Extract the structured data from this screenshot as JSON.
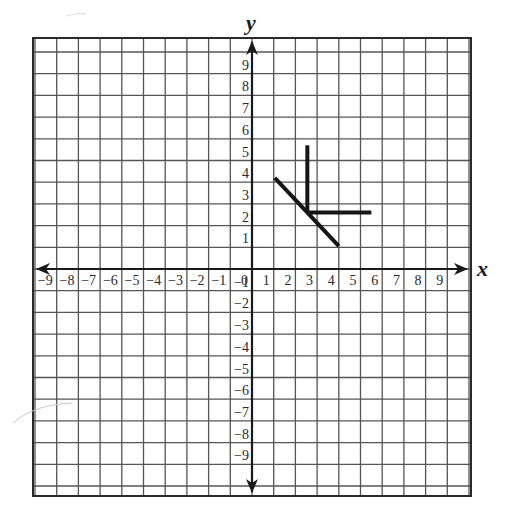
{
  "chart_data": {
    "type": "line",
    "title": "",
    "xlabel": "x",
    "ylabel": "y",
    "xlim": [
      -10,
      10
    ],
    "ylim": [
      -10.5,
      10.6
    ],
    "grid": true,
    "x_ticks": [
      -9,
      -8,
      -7,
      -6,
      -5,
      -4,
      -3,
      -2,
      -1,
      0,
      1,
      2,
      3,
      4,
      5,
      6,
      7,
      8,
      9
    ],
    "x_tick_labels": [
      "−9",
      "−8",
      "−7",
      "−6",
      "−5",
      "−4",
      "−3",
      "−2",
      "−1",
      "0",
      "1",
      "2",
      "3",
      "4",
      "5",
      "6",
      "7",
      "8",
      "9"
    ],
    "y_ticks": [
      9,
      8,
      7,
      6,
      5,
      4,
      3,
      2,
      1,
      -1,
      -2,
      -3,
      -4,
      -5,
      -6,
      -7,
      -8,
      -9
    ],
    "y_tick_labels": [
      "9",
      "8",
      "7",
      "6",
      "5",
      "4",
      "3",
      "2",
      "1",
      "−1",
      "−2",
      "−3",
      "−4",
      "−5",
      "−6",
      "−7",
      "−8",
      "−9"
    ],
    "series": [
      {
        "name": "vertical-segment",
        "points": [
          [
            2.55,
            5.7
          ],
          [
            2.55,
            2.6
          ]
        ]
      },
      {
        "name": "horizontal-segment",
        "points": [
          [
            2.55,
            2.6
          ],
          [
            5.5,
            2.6
          ]
        ]
      },
      {
        "name": "diagonal-segment",
        "points": [
          [
            1.05,
            4.2
          ],
          [
            4.0,
            1.05
          ]
        ]
      }
    ],
    "colors": {
      "grid": "#555555",
      "frame": "#2a2a2a",
      "axis": "#1a1a1a",
      "segments": "#151515"
    }
  },
  "layout": {
    "origin_px": [
      252,
      269
    ],
    "unit_px": 21.7,
    "frame_px": {
      "left": 33,
      "top": 38,
      "right": 471,
      "bottom": 496
    }
  }
}
